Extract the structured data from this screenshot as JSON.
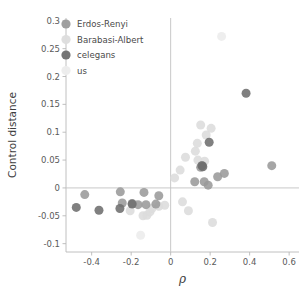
{
  "chart_data": {
    "type": "scatter",
    "title": "",
    "xlabel": "ρ",
    "ylabel": "Control distance",
    "xlim": [
      -0.53,
      0.65
    ],
    "ylim": [
      -0.115,
      0.305
    ],
    "xticks": [
      -0.4,
      -0.2,
      0,
      0.2,
      0.4,
      0.6
    ],
    "xticklabels": [
      "-0.4",
      "-0.2",
      "0",
      "0.2",
      "0.4",
      "0.6"
    ],
    "yticks": [
      0.3,
      0.25,
      0.2,
      0.15,
      0.1,
      0.05,
      0,
      -0.05,
      -0.1
    ],
    "yticklabels": [
      "0.3",
      "0.25",
      "0.2",
      "0.15",
      "0.1",
      "0.05",
      "0",
      "-0.05",
      "-0.1"
    ],
    "grid": false,
    "zero_lines": {
      "x": 0,
      "y": 0
    },
    "legend_position": "upper-left",
    "marker_size_px": 9,
    "series": [
      {
        "name": "Erdos-Renyi",
        "color": "#9a9a9a",
        "points": [
          [
            -0.435,
            -0.012
          ],
          [
            -0.255,
            -0.007
          ],
          [
            -0.245,
            -0.027
          ],
          [
            -0.195,
            -0.028
          ],
          [
            -0.165,
            -0.03
          ],
          [
            -0.135,
            -0.008
          ],
          [
            -0.125,
            -0.03
          ],
          [
            -0.075,
            -0.029
          ],
          [
            -0.06,
            -0.014
          ],
          [
            0.122,
            0.011
          ],
          [
            0.152,
            0.037
          ],
          [
            0.16,
            0.04
          ],
          [
            0.17,
            0.011
          ],
          [
            0.19,
            0.005
          ],
          [
            0.238,
            0.02
          ],
          [
            0.272,
            0.026
          ],
          [
            0.512,
            0.04
          ]
        ]
      },
      {
        "name": "Barabasi-Albert",
        "color": "#dcdcdc",
        "points": [
          [
            -0.205,
            -0.041
          ],
          [
            -0.14,
            -0.05
          ],
          [
            -0.12,
            -0.049
          ],
          [
            -0.105,
            -0.043
          ],
          [
            -0.095,
            -0.037
          ],
          [
            -0.06,
            -0.033
          ],
          [
            -0.03,
            -0.031
          ],
          [
            0.02,
            0.018
          ],
          [
            0.048,
            0.032
          ],
          [
            0.06,
            -0.025
          ],
          [
            0.075,
            0.055
          ],
          [
            0.09,
            -0.041
          ],
          [
            0.125,
            0.066
          ],
          [
            0.135,
            0.08
          ],
          [
            0.138,
            0.05
          ],
          [
            0.152,
            0.113
          ],
          [
            0.172,
            0.048
          ],
          [
            0.18,
            0.095
          ],
          [
            0.205,
            0.107
          ],
          [
            0.212,
            -0.062
          ]
        ]
      },
      {
        "name": "celegans",
        "color": "#6e6e6e",
        "points": [
          [
            -0.478,
            -0.035
          ],
          [
            -0.363,
            -0.04
          ],
          [
            -0.257,
            -0.037
          ],
          [
            -0.195,
            -0.029
          ],
          [
            0.158,
            0.04
          ],
          [
            0.163,
            0.038
          ],
          [
            0.195,
            0.082
          ],
          [
            0.382,
            0.17
          ]
        ]
      },
      {
        "name": "us",
        "color": "#ececec",
        "points": [
          [
            -0.152,
            -0.085
          ],
          [
            0.258,
            0.272
          ]
        ]
      }
    ]
  },
  "legend": {
    "entries": [
      {
        "label": "Erdos-Renyi",
        "color": "#9a9a9a"
      },
      {
        "label": "Barabasi-Albert",
        "color": "#dcdcdc"
      },
      {
        "label": "celegans",
        "color": "#6e6e6e"
      },
      {
        "label": "us",
        "color": "#ececec"
      }
    ]
  },
  "axes": {
    "x_title": "ρ",
    "y_title": "Control distance"
  }
}
